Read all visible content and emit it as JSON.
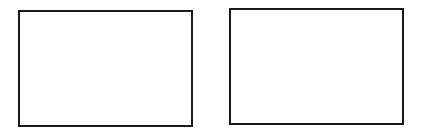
{
  "diagram": {
    "boxes": [
      {
        "id": "left",
        "label": "",
        "border_color": "#1a1a1a",
        "fill": "#ffffff"
      },
      {
        "id": "right",
        "label": "",
        "border_color": "#1a1a1a",
        "fill": "#ffffff"
      }
    ]
  }
}
